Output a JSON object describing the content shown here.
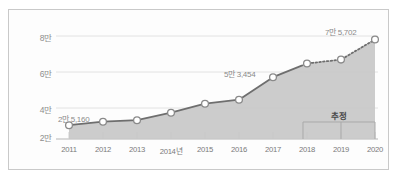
{
  "chart_data": {
    "type": "area",
    "title": "",
    "subtitle": "",
    "xlabel": "",
    "ylabel": "",
    "categories": [
      "2011",
      "2012",
      "2013",
      "2014년",
      "2015",
      "2016",
      "2017",
      "2018",
      "2019",
      "2020"
    ],
    "values": [
      25160,
      27200,
      28100,
      32500,
      37800,
      40200,
      53454,
      61500,
      63800,
      75702
    ],
    "series": [
      {
        "name": "",
        "values": [
          25160,
          27200,
          28100,
          32500,
          37800,
          40200,
          53454,
          61500,
          63800,
          75702
        ]
      }
    ],
    "ylim": [
      17000,
      86000
    ],
    "ytick_values": [
      20000,
      40000,
      60000,
      80000
    ],
    "ytick_labels": [
      "2만",
      "4만",
      "6만",
      "8만"
    ],
    "grid": true,
    "legend": false,
    "point_labels": [
      {
        "index": 0,
        "text": "2만 5,160"
      },
      {
        "index": 6,
        "text": "5만 3,454"
      },
      {
        "index": 9,
        "text": "7만 5,702"
      }
    ],
    "forecast": {
      "label": "추정",
      "start_category": "2018",
      "end_category": "2020",
      "line_style": "dotted"
    },
    "colors": {
      "line": "#6e6e6e",
      "area_fill": "#c7c7c7",
      "marker_fill": "#ffffff",
      "marker_stroke": "#8a8a8a",
      "gridline": "#e2e2e2",
      "axis": "#b5b5b5",
      "label_text": "#8a8a8a",
      "tick_text": "#7a7a7a",
      "forecast_text": "#4a4a4a",
      "frame_border": "#c9c9c9",
      "background": "#fdfdfd"
    }
  }
}
